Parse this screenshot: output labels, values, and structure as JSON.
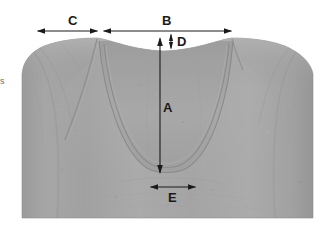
{
  "image": {
    "subject": "grey t-shirt neckline measurement diagram",
    "background_color": "#ffffff",
    "width": 323,
    "height": 237
  },
  "garment": {
    "name": "t-shirt",
    "fabric_color": "#a3a3a3",
    "fabric_shadow_color": "#8f8f8f",
    "fabric_highlight_color": "#b4b4b4",
    "seam_color": "#8a8a8a",
    "left_edge_x": 22,
    "right_edge_x": 313,
    "bottom_edge_y": 218,
    "shoulder_left_x": 97,
    "shoulder_right_x": 232,
    "shoulder_y": 38,
    "collar_dip_y": 51
  },
  "measurements": {
    "line_color": "#1a1a1a",
    "items": [
      {
        "id": "A",
        "label": "A",
        "description": "neckline drop, front center to bottom of scoop",
        "orientation": "vertical",
        "arrow": "double",
        "x": 160,
        "y_start": 38,
        "y_end": 173,
        "label_x": 163,
        "label_y": 101
      },
      {
        "id": "B",
        "label": "B",
        "description": "shoulder to shoulder width",
        "orientation": "horizontal",
        "arrow": "double",
        "y": 31,
        "x_start": 103,
        "x_end": 232,
        "label_x": 162,
        "label_y": 14
      },
      {
        "id": "C",
        "label": "C",
        "description": "sleeve / shoulder extension width",
        "orientation": "horizontal",
        "arrow": "double",
        "y": 31,
        "x_start": 37,
        "x_end": 98,
        "label_x": 68,
        "label_y": 14
      },
      {
        "id": "D",
        "label": "D",
        "description": "collar band height",
        "orientation": "vertical",
        "arrow": "double",
        "x": 171,
        "y_start": 34,
        "y_end": 49,
        "label_x": 177,
        "label_y": 35
      },
      {
        "id": "E",
        "label": "E",
        "description": "width at bottom of neckline scoop",
        "orientation": "horizontal",
        "arrow": "double",
        "y": 187,
        "x_start": 150,
        "x_end": 196,
        "label_x": 168,
        "label_y": 191
      }
    ]
  },
  "edge_artifact": {
    "text": "s",
    "x": 0,
    "y": 77
  }
}
